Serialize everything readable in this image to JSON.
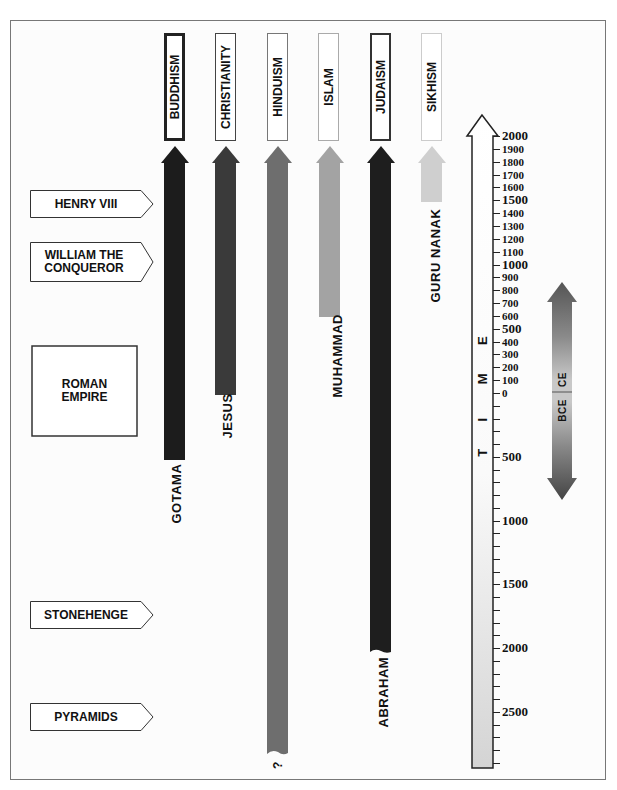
{
  "religions": [
    {
      "name": "BUDDHISM",
      "founder": "GOTAMA",
      "color": "#1c1c1c",
      "header_border": "#222",
      "header_border_width": 3
    },
    {
      "name": "CHRISTIANITY",
      "founder": "JESUS",
      "color": "#3a3a3a",
      "header_border": "#444",
      "header_border_width": 1
    },
    {
      "name": "HINDUISM",
      "founder": "?",
      "color": "#6e6e6e",
      "header_border": "#777",
      "header_border_width": 1
    },
    {
      "name": "ISLAM",
      "founder": "MUHAMMAD",
      "color": "#a3a3a3",
      "header_border": "#aaa",
      "header_border_width": 1
    },
    {
      "name": "JUDAISM",
      "founder": "ABRAHAM",
      "color": "#1e1e1e",
      "header_border": "#333",
      "header_border_width": 2
    },
    {
      "name": "SIKHISM",
      "founder": "GURU NANAK",
      "color": "#cfcfcf",
      "header_border": "#ccc",
      "header_border_width": 1
    }
  ],
  "events": [
    {
      "label": "HENRY VIII"
    },
    {
      "label": "WILLIAM THE CONQUEROR"
    },
    {
      "label": "ROMAN EMPIRE"
    },
    {
      "label": "STONEHENGE"
    },
    {
      "label": "PYRAMIDS"
    }
  ],
  "time_axis": {
    "title_letters": [
      "T",
      "I",
      "M",
      "E"
    ],
    "ce_ticks": [
      "2000",
      "1900",
      "1800",
      "1700",
      "1600",
      "1500",
      "1400",
      "1300",
      "1200",
      "1100",
      "1000",
      "900",
      "800",
      "700",
      "600",
      "500",
      "400",
      "300",
      "200",
      "100",
      "0"
    ],
    "bce_ticks": [
      "500",
      "1000",
      "1500",
      "2000",
      "2500"
    ]
  },
  "era_arrow": {
    "upper": "CE",
    "lower": "BCE"
  },
  "chart_data": {
    "type": "timeline",
    "title": "",
    "axis": {
      "label": "TIME",
      "ce_range": [
        0,
        2000
      ],
      "bce_range": [
        0,
        2500
      ],
      "ce_step": 100,
      "bce_step": 500
    },
    "series": [
      {
        "name": "Buddhism",
        "founder": "Gotama",
        "start": -500,
        "end": 2000
      },
      {
        "name": "Christianity",
        "founder": "Jesus",
        "start": 0,
        "end": 2000
      },
      {
        "name": "Hinduism",
        "founder": "?",
        "start": -2800,
        "end": 2000
      },
      {
        "name": "Islam",
        "founder": "Muhammad",
        "start": 600,
        "end": 2000
      },
      {
        "name": "Judaism",
        "founder": "Abraham",
        "start": -2000,
        "end": 2000
      },
      {
        "name": "Sikhism",
        "founder": "Guru Nanak",
        "start": 1500,
        "end": 2000
      }
    ],
    "events": [
      {
        "label": "Henry VIII",
        "year": 1500
      },
      {
        "label": "William the Conqueror",
        "year": 1066
      },
      {
        "label": "Roman Empire",
        "start": -100,
        "end": 400
      },
      {
        "label": "Stonehenge",
        "year": -1800
      },
      {
        "label": "Pyramids",
        "year": -2500
      }
    ]
  }
}
